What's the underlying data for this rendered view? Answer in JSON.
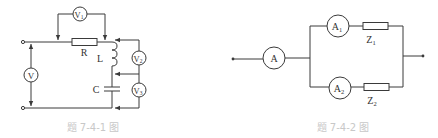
{
  "figures": [
    {
      "id": "fig-7-4-1",
      "caption": "题 7-4-1 图",
      "components": {
        "resistor": "R",
        "inductor": "L",
        "capacitor": "C",
        "voltmeter_main": "V",
        "voltmeter_1": "V",
        "voltmeter_1_sub": "1",
        "voltmeter_2": "V",
        "voltmeter_2_sub": "2",
        "voltmeter_3": "V",
        "voltmeter_3_sub": "3"
      }
    },
    {
      "id": "fig-7-4-2",
      "caption": "题 7-4-2 图",
      "components": {
        "ammeter_main": "A",
        "ammeter_1": "A",
        "ammeter_1_sub": "1",
        "ammeter_2": "A",
        "ammeter_2_sub": "2",
        "impedance_1": "Z",
        "impedance_1_sub": "1",
        "impedance_2": "Z",
        "impedance_2_sub": "2"
      }
    }
  ],
  "colors": {
    "line": "#3a3a3a",
    "caption": "#c8c8c8",
    "background": "#ffffff"
  }
}
